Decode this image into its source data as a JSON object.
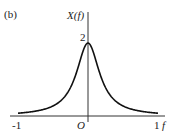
{
  "chart_data": {
    "type": "line",
    "panel_label": "(b)",
    "title": "",
    "xlabel": "f",
    "ylabel": "X(f)",
    "xlim": [
      -1,
      1
    ],
    "ylim": [
      0,
      2
    ],
    "x_ticks": [
      "-1",
      "O",
      "1"
    ],
    "y_ticks": [
      "2"
    ],
    "grid": false,
    "function": "X(f) = 2 / (1 + (5f)^2)",
    "series": [
      {
        "name": "X(f)",
        "x": [
          -1.0,
          -0.8,
          -0.6,
          -0.5,
          -0.4,
          -0.3,
          -0.25,
          -0.2,
          -0.15,
          -0.1,
          -0.05,
          0.0,
          0.05,
          0.1,
          0.15,
          0.2,
          0.25,
          0.3,
          0.4,
          0.5,
          0.6,
          0.8,
          1.0
        ],
        "values": [
          0.077,
          0.118,
          0.2,
          0.276,
          0.4,
          0.615,
          0.78,
          1.0,
          1.28,
          1.6,
          1.88,
          2.0,
          1.88,
          1.6,
          1.28,
          1.0,
          0.78,
          0.615,
          0.4,
          0.276,
          0.2,
          0.118,
          0.077
        ]
      }
    ]
  }
}
